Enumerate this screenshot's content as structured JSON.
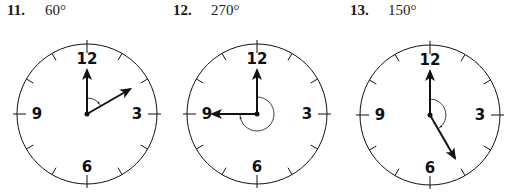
{
  "problems": [
    {
      "number": "11.",
      "angle_label": "60°",
      "angle_deg": 60,
      "hand2_hour": 2,
      "arc_direction": "clockwise",
      "center": [
        87,
        114
      ]
    },
    {
      "number": "12.",
      "angle_label": "270°",
      "angle_deg": 270,
      "hand2_hour": 9,
      "arc_direction": "clockwise",
      "center": [
        257,
        114
      ]
    },
    {
      "number": "13.",
      "angle_label": "150°",
      "angle_deg": 150,
      "hand2_hour": 5,
      "arc_direction": "clockwise",
      "center": [
        430,
        115
      ]
    }
  ],
  "clock_numbers": {
    "top": "12",
    "right": "3",
    "bottom": "6",
    "left": "9"
  },
  "colors": {
    "stroke": "#111111",
    "background": "#ffffff"
  }
}
